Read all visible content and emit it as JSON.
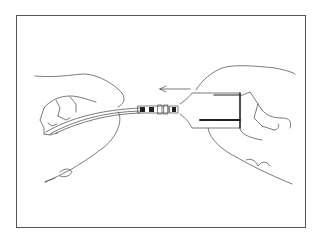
{
  "illustration": {
    "subject": "Two hands connecting a cable plug into a connector housing",
    "arrow_direction": "left",
    "colors": {
      "line": "#444444",
      "fill_dark": "#222222",
      "frame": "#555555",
      "background": "#ffffff"
    }
  }
}
